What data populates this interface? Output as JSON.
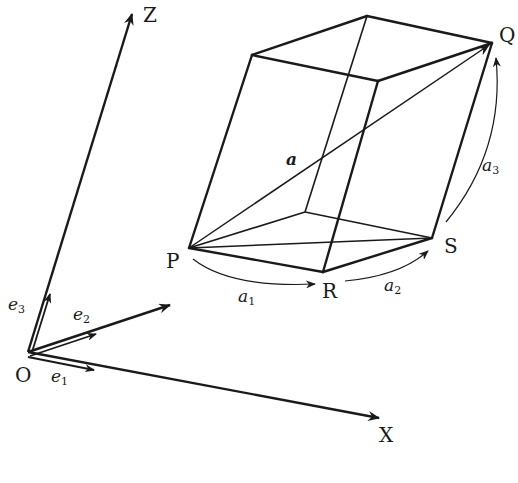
{
  "figure": {
    "axes": {
      "origin_label": "O",
      "x_label": "X",
      "z_label": "Z"
    },
    "unit_vectors": {
      "e1": {
        "base": "e",
        "sub": "1"
      },
      "e2": {
        "base": "e",
        "sub": "2"
      },
      "e3": {
        "base": "e",
        "sub": "3"
      }
    },
    "vertices": {
      "P": "P",
      "R": "R",
      "S": "S",
      "Q": "Q"
    },
    "vectors": {
      "diagonal": "a",
      "a1": {
        "base": "a",
        "sub": "1"
      },
      "a2": {
        "base": "a",
        "sub": "2"
      },
      "a3": {
        "base": "a",
        "sub": "3"
      }
    },
    "colors": {
      "ink": "#1a1a1a",
      "background": "#ffffff"
    }
  }
}
